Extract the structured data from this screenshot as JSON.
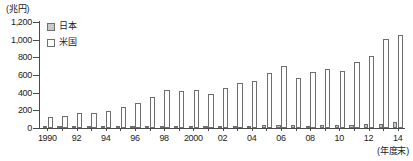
{
  "chart_data": {
    "type": "bar",
    "title": "",
    "subtitle": "",
    "unit_label": "(兆円)",
    "xlabel": "(年度末)",
    "ylabel": "",
    "ylim": [
      0,
      1200
    ],
    "ytick_values": [
      0,
      200,
      400,
      600,
      800,
      1000,
      1200
    ],
    "ytick_labels": [
      "0",
      "200",
      "400",
      "600",
      "800",
      "1,000",
      "1,200"
    ],
    "grid": false,
    "legend_position": "top-left",
    "categories": [
      "1990",
      "1991",
      "1992",
      "1993",
      "1994",
      "1995",
      "1996",
      "1997",
      "1998",
      "1999",
      "2000",
      "2001",
      "2002",
      "2003",
      "2004",
      "2005",
      "2006",
      "2007",
      "2008",
      "2009",
      "2010",
      "2011",
      "2012",
      "2013",
      "2014"
    ],
    "xtick_labels": [
      "1990",
      "",
      "92",
      "",
      "94",
      "",
      "96",
      "",
      "98",
      "",
      "2000",
      "",
      "02",
      "",
      "04",
      "",
      "06",
      "",
      "08",
      "",
      "10",
      "",
      "12",
      "",
      "14"
    ],
    "series": [
      {
        "name": "日本",
        "color": "#c9c9c9",
        "values": [
          9,
          8,
          8,
          9,
          10,
          11,
          12,
          13,
          15,
          18,
          17,
          16,
          17,
          20,
          26,
          38,
          36,
          30,
          28,
          34,
          32,
          38,
          40,
          48,
          63
        ]
      },
      {
        "name": "米国",
        "color": "#ffffff",
        "values": [
          120,
          133,
          168,
          170,
          193,
          240,
          288,
          350,
          430,
          423,
          435,
          382,
          450,
          505,
          535,
          618,
          703,
          562,
          632,
          663,
          642,
          748,
          812,
          1010,
          1058
        ]
      }
    ]
  },
  "legend": {
    "items": [
      {
        "label": "日本",
        "swatch": "filled-gray"
      },
      {
        "label": "米国",
        "swatch": "outline-white"
      }
    ]
  },
  "colors": {
    "axis": "#4a4a4a",
    "bar_outline": "#6e6e6e",
    "japan_fill": "#c9c9c9",
    "usa_fill": "#ffffff",
    "background": "#ffffff"
  }
}
